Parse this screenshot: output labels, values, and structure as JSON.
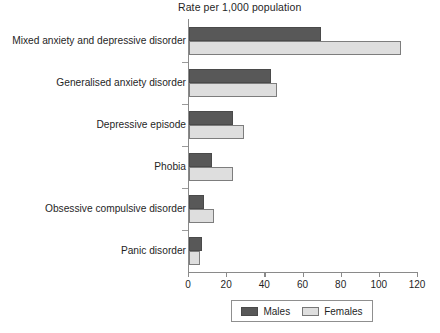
{
  "chart_data": {
    "type": "bar",
    "orientation": "horizontal",
    "title": "Rate per 1,000 population",
    "xlabel": "",
    "ylabel": "",
    "xlim": [
      0,
      120
    ],
    "xticks": [
      0,
      20,
      40,
      60,
      80,
      100,
      120
    ],
    "grid": false,
    "legend_position": "bottom",
    "categories": [
      "Mixed anxiety and depressive disorder",
      "Generalised anxiety disorder",
      "Depressive episode",
      "Phobia",
      "Obsessive compulsive disorder",
      "Panic disorder"
    ],
    "series": [
      {
        "name": "Males",
        "color": "#585858",
        "values": [
          69,
          43,
          23,
          12,
          8,
          7
        ]
      },
      {
        "name": "Females",
        "color": "#dedede",
        "values": [
          111,
          46,
          29,
          23,
          13,
          6
        ]
      }
    ]
  },
  "legend": {
    "items": [
      {
        "label": "Males",
        "swatch": "males"
      },
      {
        "label": "Females",
        "swatch": "females"
      }
    ]
  },
  "axis": {
    "tick_labels": [
      "0",
      "20",
      "40",
      "60",
      "80",
      "100",
      "120"
    ]
  }
}
